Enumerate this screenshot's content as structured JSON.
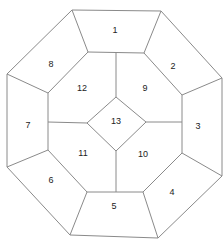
{
  "diagram": {
    "type": "octagon-partition",
    "stroke_color": "#8a8a8a",
    "label_color": "#222222",
    "regions": [
      {
        "id": "1",
        "label": "1",
        "x": 115,
        "y": 31
      },
      {
        "id": "2",
        "label": "2",
        "x": 173,
        "y": 67
      },
      {
        "id": "3",
        "label": "3",
        "x": 198,
        "y": 127
      },
      {
        "id": "4",
        "label": "4",
        "x": 172,
        "y": 193
      },
      {
        "id": "5",
        "label": "5",
        "x": 114,
        "y": 207
      },
      {
        "id": "6",
        "label": "6",
        "x": 51,
        "y": 181
      },
      {
        "id": "7",
        "label": "7",
        "x": 28,
        "y": 126
      },
      {
        "id": "8",
        "label": "8",
        "x": 51,
        "y": 65
      },
      {
        "id": "9",
        "label": "9",
        "x": 145,
        "y": 89
      },
      {
        "id": "10",
        "label": "10",
        "x": 143,
        "y": 155
      },
      {
        "id": "11",
        "label": "11",
        "x": 83,
        "y": 154
      },
      {
        "id": "12",
        "label": "12",
        "x": 82,
        "y": 89
      },
      {
        "id": "13",
        "label": "13",
        "x": 116,
        "y": 122
      }
    ]
  }
}
